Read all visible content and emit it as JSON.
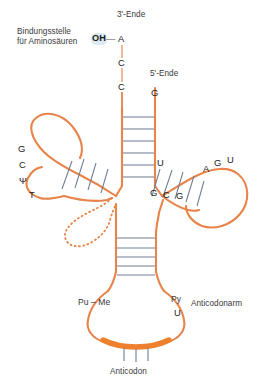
{
  "figure": {
    "colors": {
      "backbone": "#e8834a",
      "backbone_light": "#ef9a6a",
      "rung": "#6f7e92",
      "text": "#3a3a3a",
      "base_text": "#1f1f1f",
      "anticodon_bar": "#ee7f2d",
      "oh_highlight": "#dde8f0",
      "background": "#ffffff"
    },
    "labels": {
      "binding_site_line1": "Bindungsstelle",
      "binding_site_line2": "für Aminosäuren",
      "three_prime_end": "3'-Ende",
      "five_prime_end": "5'-Ende",
      "anticodon_arm": "Anticodonarm",
      "anticodon": "Anticodon",
      "oh": "OH",
      "oh_dash": "—"
    },
    "acceptor_stem": {
      "three_prime_bases": [
        "A",
        "C",
        "C"
      ],
      "five_prime_bases": [
        "G"
      ],
      "base_pair_count": 6
    },
    "t_loop": {
      "name": "TΨC-Arm",
      "bases": [
        "G",
        "C",
        "Ψ",
        "T"
      ],
      "stem_rung_count": 4
    },
    "d_loop": {
      "name": "D-Arm",
      "bases": [
        "U",
        "G",
        "C",
        "G",
        "A",
        "G",
        "U"
      ],
      "top_left_base": "U",
      "bottom_left_bases": [
        "G",
        "C",
        "G"
      ],
      "loop_top_bases": [
        "A",
        "G",
        "U"
      ],
      "stem_rung_count": 5
    },
    "variable_loop": {
      "style": "dotted"
    },
    "anticodon_stem": {
      "rung_count": 5
    },
    "anticodon_loop": {
      "left_label": "Pu – Me",
      "right_upper": "Py",
      "right_lower": "U",
      "tick_count": 3
    }
  }
}
